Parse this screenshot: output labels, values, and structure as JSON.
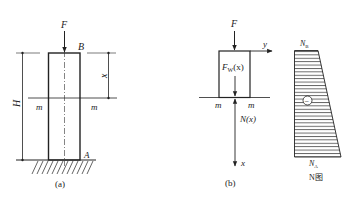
{
  "figure_a": {
    "caption": "(a)",
    "force_label": "F",
    "top_label": "B",
    "bottom_label": "A",
    "height_label": "H",
    "distance_label": "x",
    "section_left": "m",
    "section_right": "m"
  },
  "figure_b": {
    "caption": "(b)",
    "force_label": "F",
    "y_axis_label": "y",
    "x_axis_label": "x",
    "weight_label_main": "F",
    "weight_label_sub": "W",
    "weight_label_arg": "(x)",
    "internal_force_label": "N(x)",
    "section_left": "m",
    "section_right": "m"
  },
  "n_diagram": {
    "top_label_main": "N",
    "top_label_sub": "B",
    "bottom_label_main": "N",
    "bottom_label_sub": "A",
    "title": "N图",
    "sign": "−"
  },
  "colors": {
    "stroke": "#222222",
    "background": "#ffffff"
  }
}
